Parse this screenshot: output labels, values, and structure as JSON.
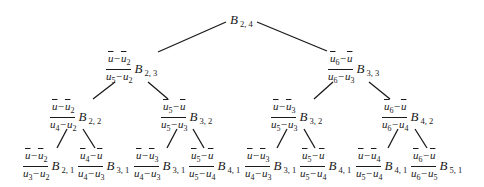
{
  "diagram": {
    "type": "tree",
    "edges": [
      {
        "from": "root",
        "to": "l1_left",
        "x1": 226,
        "y1": 22,
        "x2": 158,
        "y2": 52
      },
      {
        "from": "root",
        "to": "l1_right",
        "x1": 257,
        "y1": 22,
        "x2": 327,
        "y2": 51
      },
      {
        "from": "l1_left",
        "to": "l2_0",
        "x1": 115,
        "y1": 82,
        "x2": 93,
        "y2": 99
      },
      {
        "from": "l1_left",
        "to": "l2_1",
        "x1": 148,
        "y1": 82,
        "x2": 168,
        "y2": 99
      },
      {
        "from": "l1_right",
        "to": "l2_2",
        "x1": 333,
        "y1": 82,
        "x2": 314,
        "y2": 99
      },
      {
        "from": "l1_right",
        "to": "l2_3",
        "x1": 369,
        "y1": 82,
        "x2": 390,
        "y2": 99
      },
      {
        "from": "l2_0",
        "to": "l3_0",
        "x1": 67,
        "y1": 129,
        "x2": 57,
        "y2": 148
      },
      {
        "from": "l2_0",
        "to": "l3_1",
        "x1": 83,
        "y1": 129,
        "x2": 95,
        "y2": 148
      },
      {
        "from": "l2_1",
        "to": "l3_2",
        "x1": 177,
        "y1": 129,
        "x2": 167,
        "y2": 148
      },
      {
        "from": "l2_1",
        "to": "l3_3",
        "x1": 193,
        "y1": 129,
        "x2": 204,
        "y2": 148
      },
      {
        "from": "l2_2",
        "to": "l3_4",
        "x1": 287,
        "y1": 129,
        "x2": 277,
        "y2": 148
      },
      {
        "from": "l2_2",
        "to": "l3_5",
        "x1": 304,
        "y1": 129,
        "x2": 315,
        "y2": 148
      },
      {
        "from": "l2_3",
        "to": "l3_6",
        "x1": 398,
        "y1": 129,
        "x2": 388,
        "y2": 148
      },
      {
        "from": "l2_3",
        "to": "l3_7",
        "x1": 415,
        "y1": 129,
        "x2": 427,
        "y2": 148
      }
    ],
    "nodes": {
      "root": {
        "x": 230,
        "y": 12,
        "num": null,
        "den": null,
        "b": "B",
        "b_sub": "2, 4"
      },
      "l1_left": {
        "x": 105,
        "y": 53,
        "num": [
          {
            "t": "u"
          },
          {
            "t": "−"
          },
          {
            "t": "u",
            "s": "2"
          }
        ],
        "den": [
          {
            "t": "u",
            "s": "5"
          },
          {
            "t": "−"
          },
          {
            "t": "u",
            "s": "2"
          }
        ],
        "b": "B",
        "b_sub": "2, 3"
      },
      "l1_right": {
        "x": 327,
        "y": 53,
        "num": [
          {
            "t": "u",
            "s": "6"
          },
          {
            "t": "−"
          },
          {
            "t": "u"
          }
        ],
        "den": [
          {
            "t": "u",
            "s": "6"
          },
          {
            "t": "−"
          },
          {
            "t": "u",
            "s": "3"
          }
        ],
        "b": "B",
        "b_sub": "3, 3"
      },
      "l2_0": {
        "x": 49,
        "y": 101,
        "num": [
          {
            "t": "u"
          },
          {
            "t": "−"
          },
          {
            "t": "u",
            "s": "2"
          }
        ],
        "den": [
          {
            "t": "u",
            "s": "4"
          },
          {
            "t": "−"
          },
          {
            "t": "u",
            "s": "2"
          }
        ],
        "b": "B",
        "b_sub": "2, 2"
      },
      "l2_1": {
        "x": 160,
        "y": 101,
        "num": [
          {
            "t": "u",
            "s": "5"
          },
          {
            "t": "−"
          },
          {
            "t": "u"
          }
        ],
        "den": [
          {
            "t": "u",
            "s": "5"
          },
          {
            "t": "−"
          },
          {
            "t": "u",
            "s": "3"
          }
        ],
        "b": "B",
        "b_sub": "3, 2"
      },
      "l2_2": {
        "x": 270,
        "y": 101,
        "num": [
          {
            "t": "u"
          },
          {
            "t": "−"
          },
          {
            "t": "u",
            "s": "3"
          }
        ],
        "den": [
          {
            "t": "u",
            "s": "5"
          },
          {
            "t": "−"
          },
          {
            "t": "u",
            "s": "3"
          }
        ],
        "b": "B",
        "b_sub": "3, 2"
      },
      "l2_3": {
        "x": 381,
        "y": 101,
        "num": [
          {
            "t": "u",
            "s": "6"
          },
          {
            "t": "−"
          },
          {
            "t": "u"
          }
        ],
        "den": [
          {
            "t": "u",
            "s": "6"
          },
          {
            "t": "−"
          },
          {
            "t": "u",
            "s": "4"
          }
        ],
        "b": "B",
        "b_sub": "4, 2"
      },
      "l3_0": {
        "x": 22,
        "y": 150,
        "num": [
          {
            "t": "u"
          },
          {
            "t": "−"
          },
          {
            "t": "u",
            "s": "2"
          }
        ],
        "den": [
          {
            "t": "u",
            "s": "3"
          },
          {
            "t": "−"
          },
          {
            "t": "u",
            "s": "2"
          }
        ],
        "b": "B",
        "b_sub": "2, 1"
      },
      "l3_1": {
        "x": 77,
        "y": 150,
        "num": [
          {
            "t": "u",
            "s": "4"
          },
          {
            "t": "−"
          },
          {
            "t": "u"
          }
        ],
        "den": [
          {
            "t": "u",
            "s": "4"
          },
          {
            "t": "−"
          },
          {
            "t": "u",
            "s": "3"
          }
        ],
        "b": "B",
        "b_sub": "3, 1"
      },
      "l3_2": {
        "x": 133,
        "y": 150,
        "num": [
          {
            "t": "u"
          },
          {
            "t": "−"
          },
          {
            "t": "u",
            "s": "3"
          }
        ],
        "den": [
          {
            "t": "u",
            "s": "4"
          },
          {
            "t": "−"
          },
          {
            "t": "u",
            "s": "3"
          }
        ],
        "b": "B",
        "b_sub": "3, 1"
      },
      "l3_3": {
        "x": 188,
        "y": 150,
        "num": [
          {
            "t": "u",
            "s": "5"
          },
          {
            "t": "−"
          },
          {
            "t": "u"
          }
        ],
        "den": [
          {
            "t": "u",
            "s": "5"
          },
          {
            "t": "−"
          },
          {
            "t": "u",
            "s": "4"
          }
        ],
        "b": "B",
        "b_sub": "4, 1"
      },
      "l3_4": {
        "x": 244,
        "y": 150,
        "num": [
          {
            "t": "u"
          },
          {
            "t": "−"
          },
          {
            "t": "u",
            "s": "3"
          }
        ],
        "den": [
          {
            "t": "u",
            "s": "4"
          },
          {
            "t": "−"
          },
          {
            "t": "u",
            "s": "3"
          }
        ],
        "b": "B",
        "b_sub": "3, 1"
      },
      "l3_5": {
        "x": 299,
        "y": 150,
        "num": [
          {
            "t": "u",
            "s": "5"
          },
          {
            "t": "−"
          },
          {
            "t": "u"
          }
        ],
        "den": [
          {
            "t": "u",
            "s": "5"
          },
          {
            "t": "−"
          },
          {
            "t": "u",
            "s": "4"
          }
        ],
        "b": "B",
        "b_sub": "4, 1"
      },
      "l3_6": {
        "x": 355,
        "y": 150,
        "num": [
          {
            "t": "u"
          },
          {
            "t": "−"
          },
          {
            "t": "u",
            "s": "4"
          }
        ],
        "den": [
          {
            "t": "u",
            "s": "5"
          },
          {
            "t": "−"
          },
          {
            "t": "u",
            "s": "4"
          }
        ],
        "b": "B",
        "b_sub": "4, 1"
      },
      "l3_7": {
        "x": 410,
        "y": 150,
        "num": [
          {
            "t": "u",
            "s": "6"
          },
          {
            "t": "−"
          },
          {
            "t": "u"
          }
        ],
        "den": [
          {
            "t": "u",
            "s": "6"
          },
          {
            "t": "−"
          },
          {
            "t": "u",
            "s": "5"
          }
        ],
        "b": "B",
        "b_sub": "5, 1"
      }
    }
  }
}
